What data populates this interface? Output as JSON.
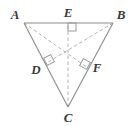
{
  "figure": {
    "type": "geometry-diagram",
    "background_color": "#ffffff",
    "solid_stroke_color": "#8c8c8c",
    "dashed_stroke_color": "#b4b4b4",
    "right_angle_stroke_color": "#9a9a9a",
    "label_color": "#3a3a3a",
    "labels": [
      {
        "id": "A",
        "text": "A",
        "x": 15,
        "y": 19,
        "anchor": "middle"
      },
      {
        "id": "B",
        "text": "B",
        "x": 121,
        "y": 19,
        "anchor": "middle"
      },
      {
        "id": "C",
        "text": "C",
        "x": 68,
        "y": 122,
        "anchor": "middle"
      },
      {
        "id": "D",
        "text": "D",
        "x": 36,
        "y": 74,
        "anchor": "middle"
      },
      {
        "id": "E",
        "text": "E",
        "x": 68,
        "y": 17,
        "anchor": "middle"
      },
      {
        "id": "F",
        "text": "F",
        "x": 97,
        "y": 72,
        "anchor": "middle"
      }
    ],
    "points": {
      "A": {
        "x": 24,
        "y": 23
      },
      "B": {
        "x": 113,
        "y": 23
      },
      "C": {
        "x": 68,
        "y": 107
      },
      "D": {
        "x": 45,
        "y": 64
      },
      "E": {
        "x": 68,
        "y": 23
      },
      "F": {
        "x": 88,
        "y": 68
      },
      "H": {
        "x": 68,
        "y": 50
      }
    },
    "solid_segments": [
      {
        "name": "side-AB",
        "from": "A",
        "to": "B"
      },
      {
        "name": "side-AC",
        "from": "A",
        "to": "C"
      },
      {
        "name": "side-BC",
        "from": "B",
        "to": "C"
      }
    ],
    "dashed_segments": [
      {
        "name": "altitude-CE",
        "from": "C",
        "to": "E"
      },
      {
        "name": "altitude-BD",
        "from": "B",
        "to": "D"
      },
      {
        "name": "altitude-AF",
        "from": "A",
        "to": "F"
      }
    ],
    "right_angle_marks": [
      {
        "name": "right-angle-at-E",
        "cx": 72,
        "cy": 27,
        "rotation": 0
      },
      {
        "name": "right-angle-at-D",
        "cx": 49,
        "cy": 60,
        "rotation": -57
      },
      {
        "name": "right-angle-at-F",
        "cx": 85,
        "cy": 64,
        "rotation": 57
      }
    ]
  }
}
